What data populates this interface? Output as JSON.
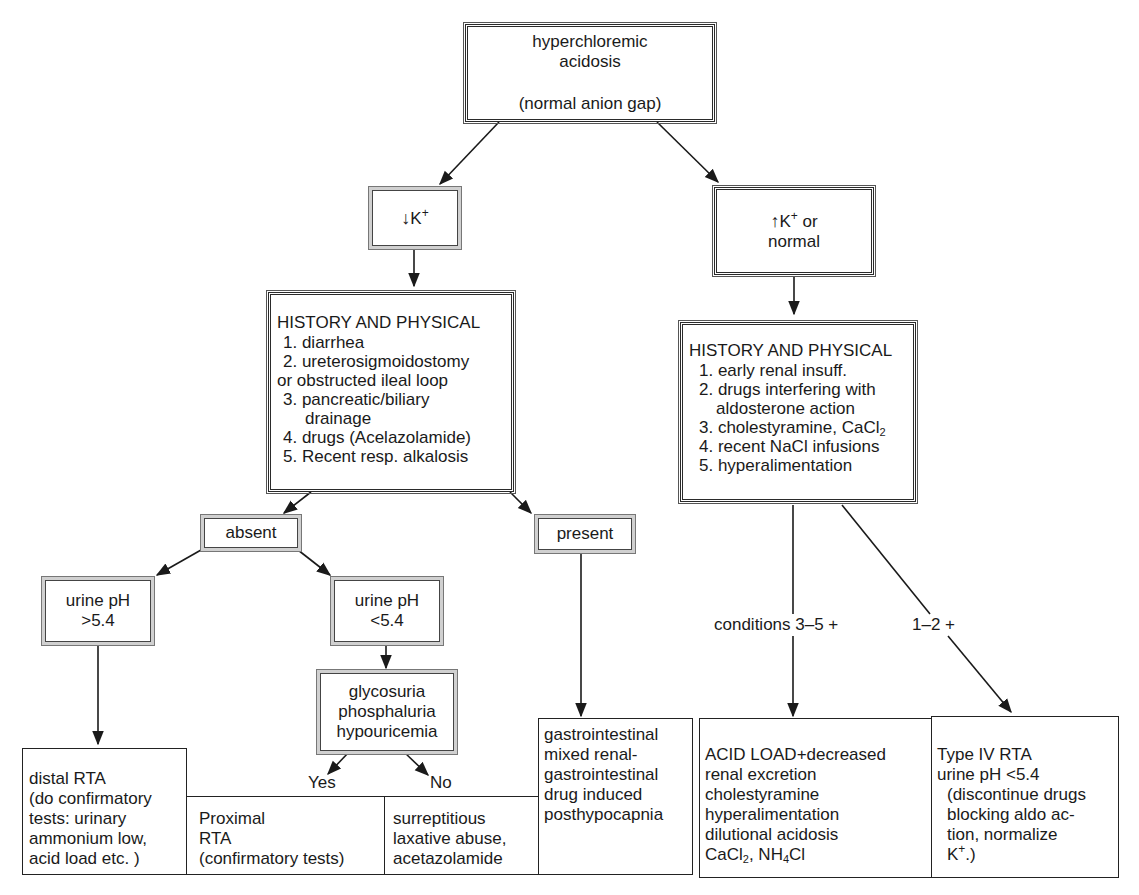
{
  "diagram": {
    "root": {
      "title_line1": "hyperchloremic",
      "title_line2": "acidosis",
      "subtitle": "(normal anion gap)"
    },
    "low_k": {
      "arrow": "↓",
      "label": "K",
      "sup": "+"
    },
    "high_k": {
      "arrow": "↑",
      "label": "K",
      "sup": "+",
      "suffix": " or",
      "line2": "normal"
    },
    "hp_left": {
      "title": "HISTORY AND PHYSICAL",
      "items": [
        "1. diarrhea",
        "2. ureterosigmoidostomy",
        "or obstructed ileal loop",
        "3. pancreatic/biliary",
        "    drainage",
        "4. drugs (Acelazolamide)",
        "5. Recent resp. alkalosis"
      ]
    },
    "hp_right": {
      "title": "HISTORY AND PHYSICAL",
      "items": [
        "1. early renal insuff.",
        "2. drugs interfering with",
        "    aldosterone action",
        "3. cholestyramine, CaCl",
        "4. recent NaCl infusions",
        "5. hyperalimentation"
      ],
      "item3_sub": "2"
    },
    "absent": "absent",
    "present": "present",
    "urine_high": {
      "line1": "urine pH",
      "line2": ">5.4"
    },
    "urine_low": {
      "line1": "urine pH",
      "line2": "<5.4"
    },
    "glyco": {
      "line1": "glycosuria",
      "line2": "phosphaluria",
      "line3": "hypouricemia"
    },
    "edge_labels": {
      "yes": "Yes",
      "no": "No",
      "conditions": "conditions 3–5 +",
      "one_two": "1–2 +"
    },
    "outcomes": {
      "distal": [
        "distal RTA",
        "(do confirmatory",
        "tests: urinary",
        "ammonium low,",
        "acid load etc. )"
      ],
      "proximal": [
        "Proximal",
        "RTA",
        "(confirmatory tests)"
      ],
      "laxative": [
        "surreptitious",
        "laxative abuse,",
        "acetazolamide"
      ],
      "gi": [
        "gastrointestinal",
        "mixed renal-",
        "gastrointestinal",
        "drug induced",
        "posthypocapnia"
      ],
      "acid_load": {
        "lines": [
          "ACID LOAD+decreased",
          "renal excretion",
          "cholestyramine",
          "hyperalimentation",
          "dilutional acidosis"
        ],
        "last_a": "CaCl",
        "last_a_sub": "2",
        "last_b": ", NH",
        "last_b_sub": "4",
        "last_c": "Cl"
      },
      "type4": {
        "lines": [
          "Type IV RTA",
          "urine pH <5.4",
          "  (discontinue drugs",
          "  blocking aldo ac-",
          "  tion, normalize"
        ],
        "last": "  K",
        "last_sup": "+",
        "last_end": ".)"
      }
    },
    "colors": {
      "line": "#1a1a1a",
      "frame_gray": "#cfcfcf",
      "background": "#ffffff"
    }
  }
}
